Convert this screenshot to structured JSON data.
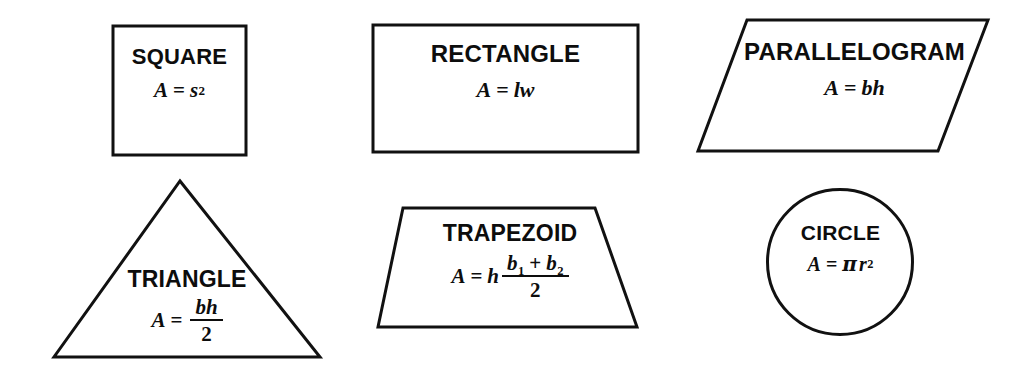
{
  "page": {
    "background_color": "#ffffff",
    "ink_color": "#0d0d0d",
    "width": 1017,
    "height": 370
  },
  "figures": [
    {
      "id": "square",
      "name": "SQUARE",
      "outline": "square",
      "formula_text": "A = s2",
      "formula_plain": "A = s²",
      "parts": {
        "lhs": "A",
        "op": "=",
        "base": "s",
        "exponent": "2"
      }
    },
    {
      "id": "rectangle",
      "name": "RECTANGLE",
      "outline": "rectangle",
      "formula_text": "A = lw",
      "formula_plain": "A = lw",
      "parts": {
        "lhs": "A",
        "op": "=",
        "rhs": "lw"
      }
    },
    {
      "id": "parallelogram",
      "name": "PARALLELOGRAM",
      "outline": "parallelogram",
      "formula_text": "A = bh",
      "formula_plain": "A = bh",
      "parts": {
        "lhs": "A",
        "op": "=",
        "rhs": "bh"
      }
    },
    {
      "id": "triangle",
      "name": "TRIANGLE",
      "outline": "triangle",
      "formula_text": "A = bh/2",
      "formula_plain": "A = bh/2",
      "parts": {
        "lhs": "A",
        "op": "=",
        "numerator": "bh",
        "denominator": "2"
      }
    },
    {
      "id": "trapezoid",
      "name": "TRAPEZOID",
      "outline": "trapezoid",
      "formula_text": "A = h (b1 + b2)/2",
      "formula_plain": "A = h(b₁ + b₂)/2",
      "parts": {
        "lhs": "A",
        "op": "=",
        "factor": "h",
        "num_first": "b",
        "num_first_sub": "1",
        "num_op": "+",
        "num_second": "b",
        "num_second_sub": "2",
        "denominator": "2"
      }
    },
    {
      "id": "circle",
      "name": "CIRCLE",
      "outline": "circle",
      "formula_text": "A = pi r2",
      "formula_plain": "A = πr²",
      "parts": {
        "lhs": "A",
        "op": "=",
        "pi": "π",
        "base": "r",
        "exponent": "2"
      }
    }
  ]
}
